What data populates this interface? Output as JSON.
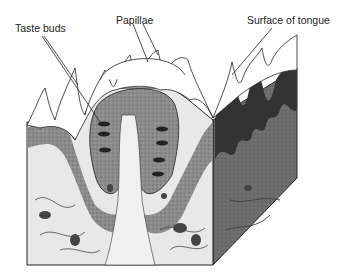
{
  "figure": {
    "labels": {
      "taste_buds": "Taste buds",
      "papillae": "Papillae",
      "surface": "Surface of tongue"
    },
    "colors": {
      "ink": "#1a1a1a",
      "tissue_mid": "#8a8a8a",
      "tissue_dark": "#4a4a4a",
      "tissue_light": "#d8d8d8",
      "background": "#ffffff"
    }
  }
}
